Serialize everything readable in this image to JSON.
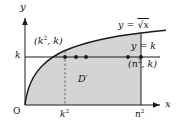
{
  "figure": {
    "name": "calculus-region-diagram",
    "background_color": "#ffffff",
    "ink_color": "#1a1a1a",
    "shade_color": "#d4d4d4",
    "axes": {
      "x_axis_label": "x",
      "y_axis_label": "y",
      "origin_label": "O",
      "x_ticks": [
        {
          "label_base": "k",
          "label_exp": "2",
          "x_px": 65
        },
        {
          "label_base": "n",
          "label_exp": "2",
          "x_px": 141
        }
      ],
      "y_ticks": [
        {
          "label": "k",
          "y_px": 57
        }
      ]
    },
    "curves": [
      {
        "name": "sqrt-curve",
        "label_base": "y = ",
        "label_func": "√x",
        "equation": "y = √x",
        "from": [
          25,
          105
        ],
        "to": [
          141,
          33
        ]
      },
      {
        "name": "horizontal-line",
        "label": "y = k",
        "equation": "y = k",
        "y_px": 57,
        "x_from": 25,
        "x_to": 160
      }
    ],
    "points": [
      {
        "name": "point-k-squared",
        "label": "(k², k)",
        "label_base_1": "(k",
        "label_exp_1": "2",
        "label_tail": ", k)",
        "x_px": 65,
        "y_px": 57
      },
      {
        "name": "point-n-squared",
        "label": "(n², k)",
        "label_base_1": "(n",
        "label_exp_1": "2",
        "label_tail": ", k)",
        "x_px": 141,
        "y_px": 57
      }
    ],
    "lattice_dots_x_px": [
      65,
      76,
      86,
      128,
      141
    ],
    "region": {
      "name": "region-D-prime",
      "label": "D′",
      "x_px": 82,
      "y_px": 80
    },
    "dashed_guide": {
      "name": "dashed-vertical-k-squared",
      "x_px": 65,
      "y_from": 57,
      "y_to": 105
    }
  }
}
